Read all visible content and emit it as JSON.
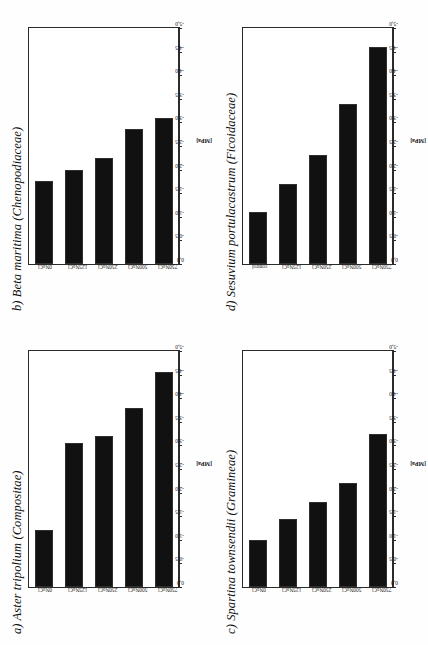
{
  "figure": {
    "axis_title": "[MPa]",
    "tick_labels": [
      "0,0",
      "-0,5",
      "-1,0",
      "-1,5",
      "-2,0",
      "-2,5",
      "-3,0",
      "-3,5",
      "-4,0",
      "-4,5",
      "-5,0"
    ]
  },
  "chart_data": [
    {
      "type": "bar",
      "panel": "a",
      "title": "a) Aster tripolium (Compositae)",
      "categories": [
        "0NaCl",
        "125NaCl",
        "250NaCl",
        "500NaCl",
        "750NaCl"
      ],
      "values": [
        -1.2,
        -3.05,
        -3.2,
        -3.8,
        -4.55
      ],
      "errors": [
        0.05,
        0.45,
        0.65,
        0.75,
        0.85
      ],
      "xlabel": "[MPa]",
      "ylabel": "",
      "xlim": [
        0.0,
        -5.0
      ],
      "grid": false,
      "legend": "none",
      "orientation": "horizontal"
    },
    {
      "type": "bar",
      "panel": "b",
      "title": "b) Beta maritima (Chenopodiaceae)",
      "categories": [
        "0NaCl",
        "125NaCl",
        "250NaCl",
        "500NaCl",
        "750NaCl"
      ],
      "values": [
        -1.75,
        -2.0,
        -2.25,
        -2.85,
        -3.1
      ],
      "errors": [
        0.05,
        0.35,
        0.6,
        0.55,
        0.55
      ],
      "xlabel": "[MPa]",
      "ylabel": "",
      "xlim": [
        0.0,
        -5.0
      ],
      "grid": false,
      "legend": "none",
      "orientation": "horizontal"
    },
    {
      "type": "bar",
      "panel": "c",
      "title": "c) Spartina townsendii (Gramineae)",
      "categories": [
        "0NaCl",
        "125NaCl",
        "250NaCl",
        "500NaCl",
        "750NaCl"
      ],
      "values": [
        -1.0,
        -1.45,
        -1.8,
        -2.2,
        -3.25
      ],
      "errors": [
        0.05,
        0.3,
        0.5,
        0.6,
        0.75
      ],
      "xlabel": "[MPa]",
      "ylabel": "",
      "xlim": [
        0.0,
        -5.0
      ],
      "grid": false,
      "legend": "none",
      "orientation": "horizontal"
    },
    {
      "type": "bar",
      "panel": "d",
      "title": "d) Sesuvium portulacastrum (Ficoidaceae)",
      "categories": [
        "control",
        "125NaCl",
        "250NaCl",
        "500NaCl",
        "750NaCl"
      ],
      "values": [
        -1.1,
        -1.7,
        -2.3,
        -3.4,
        -4.6
      ],
      "errors": [
        0.05,
        0.4,
        0.65,
        0.9,
        1.05
      ],
      "xlabel": "[MPa]",
      "ylabel": "",
      "xlim": [
        0.0,
        -5.0
      ],
      "grid": false,
      "legend": "none",
      "orientation": "horizontal"
    }
  ]
}
